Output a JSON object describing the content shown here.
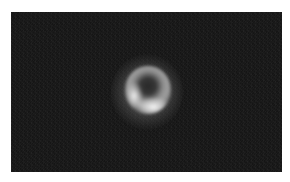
{
  "image": {
    "subject": "glowing ring with dark center on dark noisy background",
    "colors": {
      "page_background": "#ffffff",
      "image_background": "#1a1a1a",
      "ring_bright": "#f0f0f0",
      "center_dark": "#282828"
    }
  }
}
